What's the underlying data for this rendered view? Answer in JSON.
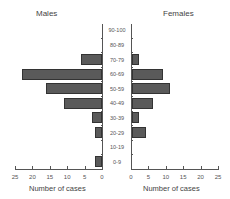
{
  "chart_data": {
    "type": "bar",
    "orientation": "horizontal",
    "subtype": "population-pyramid",
    "categories": [
      "0-9",
      "10-19",
      "20-29",
      "30-39",
      "40-49",
      "50-59",
      "60-69",
      "70-79",
      "80-89",
      "90-100"
    ],
    "series": [
      {
        "name": "Males",
        "side": "left",
        "values": [
          2,
          0,
          2,
          3,
          11,
          16,
          23,
          6,
          0,
          0
        ]
      },
      {
        "name": "Females",
        "side": "right",
        "values": [
          0,
          0,
          4,
          2,
          6,
          11,
          9,
          2,
          0,
          0
        ]
      }
    ],
    "titles": {
      "left": "Males",
      "right": "Females"
    },
    "xlabel": "Number of cases",
    "xticks_left": [
      "25",
      "20",
      "15",
      "10",
      "5",
      "0"
    ],
    "xticks_right": [
      "0",
      "5",
      "10",
      "15",
      "20",
      "25"
    ],
    "xlim": [
      0,
      25
    ],
    "grid": false,
    "bar_color": "#5a5a5a"
  }
}
